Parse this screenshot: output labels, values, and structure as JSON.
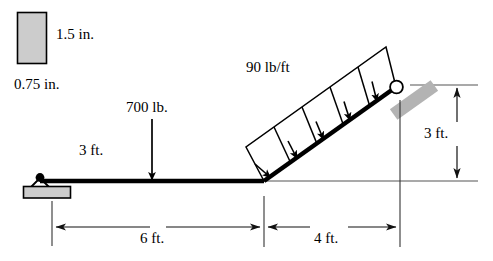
{
  "figure": {
    "type": "statics-beam-diagram",
    "width": 493,
    "height": 261,
    "background_color": "#ffffff",
    "line_color": "#000000",
    "fill_gray": "#cccccc",
    "thin_line_color": "#555555"
  },
  "cross_section": {
    "label_height": "1.5 in.",
    "label_width": "0.75 in.",
    "fill": "#cccccc",
    "stroke": "#000000"
  },
  "loads": {
    "distributed": {
      "label": "90 lb/ft",
      "magnitude": 90,
      "units": "lb/ft",
      "divisions": 5,
      "orientation": "perpendicular-to-inclined-beam"
    },
    "point": {
      "label": "700 lb.",
      "magnitude": 700,
      "units": "lb",
      "direction": "down"
    }
  },
  "dimensions": {
    "horizontal_to_point_load": "3 ft.",
    "horizontal_span": "6 ft.",
    "incline_run": "4 ft.",
    "incline_rise": "3 ft."
  },
  "supports": {
    "pin": {
      "name": "pin-support",
      "position": "left-end-of-horizontal-beam"
    },
    "roller": {
      "name": "roller-support",
      "position": "top-of-inclined-beam"
    }
  }
}
